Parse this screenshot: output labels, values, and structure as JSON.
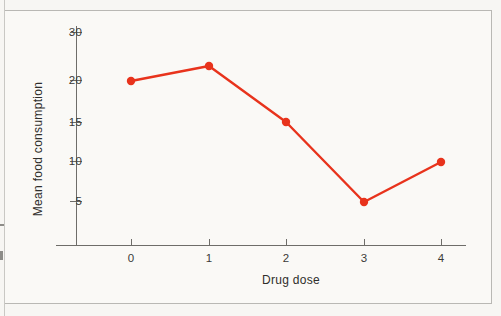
{
  "figure": {
    "background_color": "#faf9f6",
    "border_color": "#b9b8b4"
  },
  "chart_data": {
    "type": "line",
    "title": "",
    "xlabel": "Drug dose",
    "ylabel": "Mean food consumption",
    "x": [
      0,
      1,
      2,
      3,
      4
    ],
    "values": [
      20,
      21.7,
      15,
      5,
      9.9
    ],
    "series": [
      {
        "name": "Mean food consumption",
        "color": "#e8331c",
        "marker": "circle",
        "values": [
          20,
          21.7,
          15,
          5,
          9.9
        ]
      }
    ],
    "x_tick_labels": [
      "0",
      "1",
      "2",
      "3",
      "4"
    ],
    "y_tick_labels": [
      "30",
      "20",
      "15",
      "10",
      "5"
    ],
    "y_tick_values": [
      30,
      20,
      15,
      10,
      5
    ],
    "xlim": [
      -0.35,
      4.35
    ],
    "ylim": [
      0,
      32
    ],
    "grid": false,
    "legend": null
  },
  "axes": {
    "y_ticks": [
      {
        "label": "30",
        "y": 32
      },
      {
        "label": "20",
        "y": 80
      },
      {
        "label": "15",
        "y": 122
      },
      {
        "label": "10",
        "y": 161
      },
      {
        "label": "5",
        "y": 201
      }
    ],
    "x_ticks": [
      {
        "label": "0",
        "x": 131
      },
      {
        "label": "1",
        "x": 209
      },
      {
        "label": "2",
        "x": 286
      },
      {
        "label": "3",
        "x": 364
      },
      {
        "label": "4",
        "x": 441
      }
    ],
    "line_color": "#6e6d69"
  },
  "points": [
    {
      "label": "0",
      "x": 131,
      "y": 81
    },
    {
      "label": "1",
      "x": 209,
      "y": 66
    },
    {
      "label": "2",
      "x": 286,
      "y": 122
    },
    {
      "label": "3",
      "x": 364,
      "y": 202
    },
    {
      "label": "4",
      "x": 441,
      "y": 162
    }
  ]
}
